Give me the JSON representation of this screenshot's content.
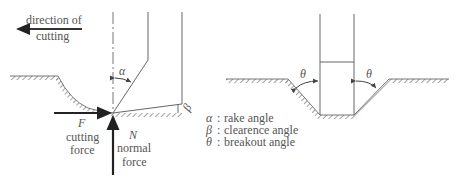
{
  "left_figure": {
    "direction_label_line1": "direction of",
    "direction_label_line2": "cutting",
    "rake_angle_symbol": "α",
    "clearance_angle_symbol": "β",
    "cutting_force_symbol": "F",
    "cutting_force_line1": "cutting",
    "cutting_force_line2": "force",
    "normal_force_symbol": "N",
    "normal_force_line1": "normal",
    "normal_force_line2": "force"
  },
  "right_figure": {
    "breakout_angle_symbol_left": "θ",
    "breakout_angle_symbol_right": "θ"
  },
  "legend": {
    "items": [
      {
        "symbol": "α",
        "sep": ":",
        "label": "rake angle"
      },
      {
        "symbol": "β",
        "sep": ":",
        "label": "clearence angle"
      },
      {
        "symbol": "θ",
        "sep": ":",
        "label": "breakout angle"
      }
    ]
  },
  "colors": {
    "line": "#555555",
    "force_arrow": "#222222",
    "text": "#555555"
  }
}
